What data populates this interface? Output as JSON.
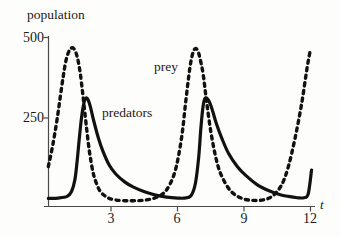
{
  "chart_data": {
    "type": "line",
    "title": "",
    "subtitle": "",
    "xlabel": "t",
    "ylabel": "population",
    "xlim": [
      0,
      12.2
    ],
    "ylim": [
      0,
      530
    ],
    "xticks": [
      3,
      6,
      9,
      12
    ],
    "xticklabels": [
      "3",
      "6",
      "9",
      "12"
    ],
    "yticks": [
      250,
      500
    ],
    "yticklabels": [
      "250",
      "500"
    ],
    "grid": false,
    "legend_position": "inline-annotations",
    "annotations": [
      {
        "text": "prey",
        "x": 5.9,
        "y": 410,
        "series": "prey"
      },
      {
        "text": "predators",
        "x": 3.4,
        "y": 275,
        "series": "predators"
      }
    ],
    "series": [
      {
        "name": "prey",
        "style": "dashed",
        "color": "#111111",
        "x": [
          0.15,
          0.35,
          0.55,
          0.75,
          0.9,
          1.0,
          1.1,
          1.2,
          1.3,
          1.4,
          1.5,
          1.6,
          1.7,
          1.8,
          1.9,
          2.0,
          2.1,
          2.2,
          2.35,
          2.5,
          2.7,
          2.9,
          3.2,
          3.6,
          4.0,
          4.4,
          4.8,
          5.2,
          5.5,
          5.8,
          6.0,
          6.2,
          6.35,
          6.5,
          6.6,
          6.7,
          6.8,
          6.9,
          7.0,
          7.15,
          7.3,
          7.5,
          7.75,
          8.0,
          8.4,
          8.9,
          9.4,
          9.9,
          10.3,
          10.7,
          11.0,
          11.3,
          11.6,
          11.85,
          12.0
        ],
        "y": [
          110,
          175,
          255,
          350,
          415,
          445,
          462,
          470,
          468,
          455,
          430,
          390,
          335,
          275,
          215,
          160,
          118,
          85,
          55,
          35,
          22,
          14,
          9,
          7,
          7,
          8,
          12,
          22,
          40,
          80,
          130,
          210,
          300,
          385,
          430,
          458,
          468,
          462,
          440,
          390,
          310,
          215,
          130,
          80,
          36,
          14,
          8,
          10,
          22,
          55,
          110,
          195,
          300,
          410,
          465
        ]
      },
      {
        "name": "predators",
        "style": "solid",
        "color": "#111111",
        "x": [
          0.15,
          0.6,
          1.0,
          1.2,
          1.35,
          1.45,
          1.55,
          1.65,
          1.75,
          1.85,
          1.95,
          2.05,
          2.2,
          2.4,
          2.6,
          2.9,
          3.2,
          3.6,
          4.0,
          4.5,
          5.0,
          5.5,
          6.0,
          6.3,
          6.6,
          6.8,
          6.95,
          7.05,
          7.15,
          7.25,
          7.4,
          7.55,
          7.75,
          8.0,
          8.3,
          8.7,
          9.1,
          9.6,
          10.1,
          10.6,
          11.0,
          11.4,
          11.7,
          11.9,
          12.05
        ],
        "y": [
          14,
          15,
          20,
          35,
          70,
          125,
          195,
          258,
          300,
          318,
          312,
          292,
          250,
          200,
          160,
          115,
          88,
          64,
          48,
          34,
          24,
          18,
          15,
          15,
          22,
          60,
          140,
          230,
          295,
          318,
          310,
          285,
          240,
          195,
          150,
          110,
          82,
          55,
          38,
          26,
          20,
          16,
          16,
          28,
          100
        ]
      }
    ]
  },
  "axes": {
    "y_axis_label": "population",
    "x_axis_label": "t",
    "y_tick_500": "500",
    "y_tick_250": "250",
    "x_tick_3": "3",
    "x_tick_6": "6",
    "x_tick_9": "9",
    "x_tick_12": "12"
  },
  "labels": {
    "prey": "prey",
    "predators": "predators"
  },
  "colors": {
    "curve": "#111111",
    "axis": "#4a4a4a",
    "background": "#fdfdfc",
    "text": "#1a1a1a"
  }
}
